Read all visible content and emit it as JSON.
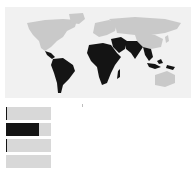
{
  "chart_data": {
    "type": "choropleth",
    "title": "",
    "map": {
      "highlighted_color": "#141414",
      "base_color": "#c9c9c9",
      "background": "#f1f1f1",
      "highlighted_regions": [
        "South America",
        "Central America",
        "Africa",
        "Middle East",
        "South Asia",
        "Southeast Asia",
        "Indonesia",
        "Papua New Guinea"
      ],
      "unhighlighted_regions": [
        "North America",
        "Greenland",
        "Europe",
        "Russia",
        "Central Asia",
        "China",
        "Australia"
      ]
    },
    "bars": {
      "type": "bar",
      "orientation": "horizontal",
      "categories": [
        "",
        "",
        "",
        ""
      ],
      "values": [
        2,
        73,
        2,
        0
      ],
      "max": 100,
      "fill_color": "#141414",
      "track_color": "#d8d8d8"
    }
  }
}
